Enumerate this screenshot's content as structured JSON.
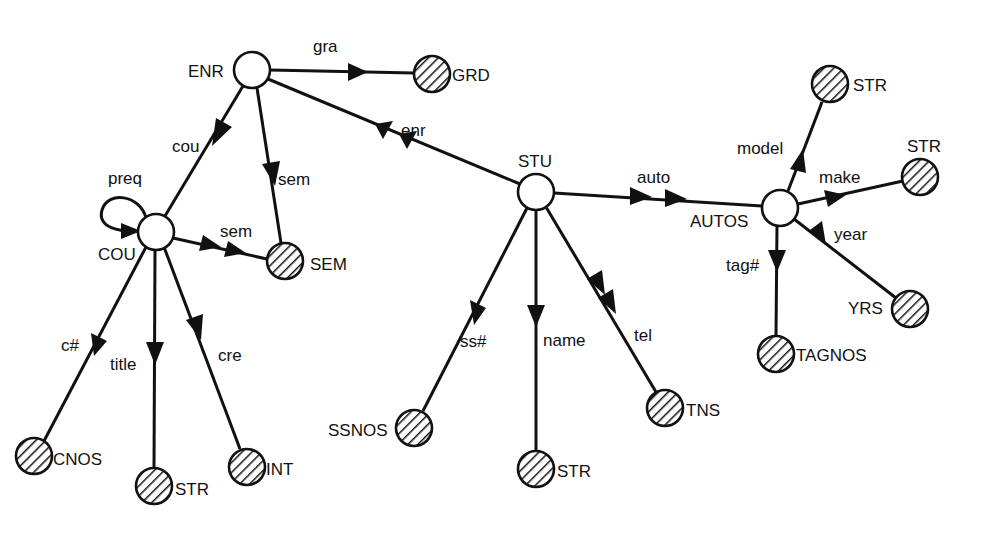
{
  "diagram": {
    "type": "semantic-data-model-graph",
    "nodes": [
      {
        "id": "ENR",
        "label": "ENR",
        "kind": "entity",
        "x": 252,
        "y": 70
      },
      {
        "id": "GRD",
        "label": "GRD",
        "kind": "value",
        "x": 432,
        "y": 74
      },
      {
        "id": "COU",
        "label": "COU",
        "kind": "entity",
        "x": 156,
        "y": 232
      },
      {
        "id": "SEM",
        "label": "SEM",
        "kind": "value",
        "x": 285,
        "y": 261
      },
      {
        "id": "STU",
        "label": "STU",
        "kind": "entity",
        "x": 536,
        "y": 192
      },
      {
        "id": "AUTOS",
        "label": "AUTOS",
        "kind": "entity",
        "x": 780,
        "y": 208
      },
      {
        "id": "STR_MODEL",
        "label": "STR",
        "kind": "value",
        "x": 830,
        "y": 84
      },
      {
        "id": "STR_MAKE",
        "label": "STR",
        "kind": "value",
        "x": 920,
        "y": 177
      },
      {
        "id": "YRS",
        "label": "YRS",
        "kind": "value",
        "x": 910,
        "y": 309
      },
      {
        "id": "TAGNOS",
        "label": "TAGNOS",
        "kind": "value",
        "x": 776,
        "y": 354
      },
      {
        "id": "SSNOS",
        "label": "SSNOS",
        "kind": "value",
        "x": 414,
        "y": 428
      },
      {
        "id": "STR_NAME",
        "label": "STR",
        "kind": "value",
        "x": 536,
        "y": 469
      },
      {
        "id": "TNS",
        "label": "TNS",
        "kind": "value",
        "x": 665,
        "y": 408
      },
      {
        "id": "CNOS",
        "label": "CNOS",
        "kind": "value",
        "x": 34,
        "y": 456
      },
      {
        "id": "STR_TITLE",
        "label": "STR",
        "kind": "value",
        "x": 154,
        "y": 486
      },
      {
        "id": "INT",
        "label": "INT",
        "kind": "value",
        "x": 247,
        "y": 467
      }
    ],
    "edges": [
      {
        "from": "ENR",
        "to": "GRD",
        "label": "gra",
        "multi": false
      },
      {
        "from": "ENR",
        "to": "COU",
        "label": "cou",
        "multi": false
      },
      {
        "from": "ENR",
        "to": "SEM",
        "label": "sem",
        "multi": false
      },
      {
        "from": "STU",
        "to": "ENR",
        "label": "enr",
        "multi": true
      },
      {
        "from": "COU",
        "to": "COU",
        "label": "preq",
        "multi": false
      },
      {
        "from": "COU",
        "to": "SEM",
        "label": "sem",
        "multi": true
      },
      {
        "from": "COU",
        "to": "CNOS",
        "label": "c#",
        "multi": false
      },
      {
        "from": "COU",
        "to": "STR_TITLE",
        "label": "title",
        "multi": false
      },
      {
        "from": "COU",
        "to": "INT",
        "label": "cre",
        "multi": false
      },
      {
        "from": "STU",
        "to": "AUTOS",
        "label": "auto",
        "multi": true
      },
      {
        "from": "STU",
        "to": "SSNOS",
        "label": "ss#",
        "multi": false
      },
      {
        "from": "STU",
        "to": "STR_NAME",
        "label": "name",
        "multi": false
      },
      {
        "from": "STU",
        "to": "TNS",
        "label": "tel",
        "multi": true
      },
      {
        "from": "AUTOS",
        "to": "STR_MODEL",
        "label": "model",
        "multi": false
      },
      {
        "from": "AUTOS",
        "to": "STR_MAKE",
        "label": "make",
        "multi": false
      },
      {
        "from": "AUTOS",
        "to": "YRS",
        "label": "year",
        "multi": false
      },
      {
        "from": "AUTOS",
        "to": "TAGNOS",
        "label": "tag#",
        "multi": false
      }
    ]
  },
  "labels": {
    "ENR": "ENR",
    "GRD": "GRD",
    "COU": "COU",
    "SEM": "SEM",
    "STU": "STU",
    "AUTOS": "AUTOS",
    "STR_MODEL": "STR",
    "STR_MAKE": "STR",
    "YRS": "YRS",
    "TAGNOS": "TAGNOS",
    "SSNOS": "SSNOS",
    "STR_NAME": "STR",
    "TNS": "TNS",
    "CNOS": "CNOS",
    "STR_TITLE": "STR",
    "INT": "INT",
    "gra": "gra",
    "cou": "cou",
    "sem_enr": "sem",
    "enr": "enr",
    "preq": "preq",
    "sem_cou": "sem",
    "c_num": "c#",
    "title": "title",
    "cre": "cre",
    "auto": "auto",
    "ss_num": "ss#",
    "name": "name",
    "tel": "tel",
    "model": "model",
    "make": "make",
    "year": "year",
    "tag_num": "tag#"
  },
  "colors": {
    "stroke": "#111111",
    "background": "#ffffff"
  }
}
